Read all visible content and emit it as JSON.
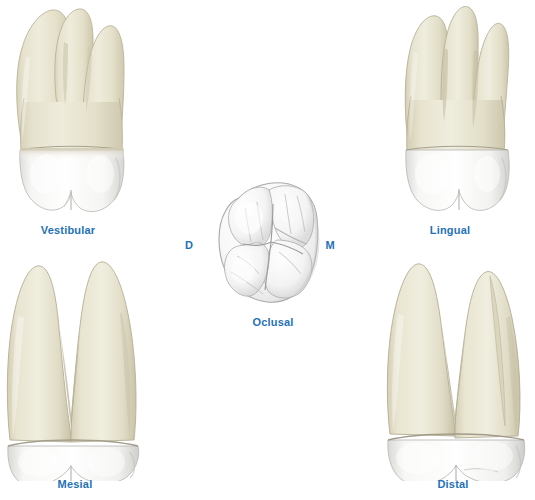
{
  "figure": {
    "background_color": "#ffffff",
    "label_color": "#1F72B8",
    "root_color": "#E3DFC9",
    "crown_color": "#FBFBFA"
  },
  "views": {
    "vestibular": {
      "label": "Vestibular",
      "root_count": 3,
      "description": "Buccal view of maxillary first molar showing three roots and white crown"
    },
    "lingual": {
      "label": "Lingual",
      "root_count": 3,
      "description": "Palatal view of maxillary first molar showing three roots and white crown"
    },
    "mesial": {
      "label": "Mesial",
      "root_count": 2,
      "description": "Mesial proximal view showing two divergent roots in V shape"
    },
    "distal": {
      "label": "Distal",
      "root_count": 2,
      "description": "Distal proximal view showing two divergent roots"
    },
    "occlusal": {
      "label": "Oclusal",
      "cusp_count": 4,
      "description": "Occlusal chewing surface showing cusps and fissure pattern"
    }
  },
  "orientation_markers": {
    "distal_marker": "D",
    "mesial_marker": "M"
  }
}
